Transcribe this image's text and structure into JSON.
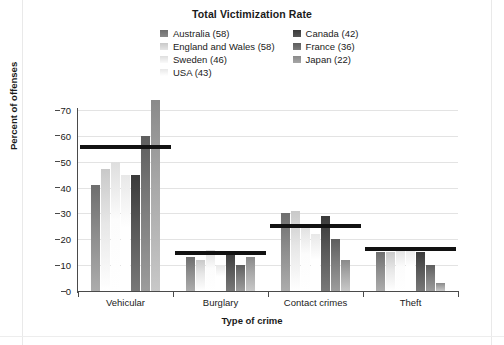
{
  "chart_data": {
    "type": "bar",
    "title": "Total Victimization Rate",
    "xlabel": "Type of crime",
    "ylabel": "Percent of offenses",
    "categories": [
      "Vehicular",
      "Burglary",
      "Contact crimes",
      "Theft"
    ],
    "ylim": [
      0,
      70
    ],
    "yticks": [
      0,
      10,
      20,
      30,
      40,
      50,
      60,
      70
    ],
    "grid": true,
    "legend_position": "top-center",
    "series": [
      {
        "name": "Australia (58)",
        "color": "#6e6e6e",
        "values": [
          41,
          13,
          30,
          15
        ]
      },
      {
        "name": "England and Wales (58)",
        "color": "#c9c9c9",
        "values": [
          47,
          12,
          31,
          15
        ]
      },
      {
        "name": "Sweden (46)",
        "color": "#dedede",
        "values": [
          50,
          16,
          26,
          17
        ]
      },
      {
        "name": "USA (43)",
        "color": "#e8e8e8",
        "values": [
          45,
          10,
          22,
          17
        ]
      },
      {
        "name": "Canada (42)",
        "color": "#3a3a3a",
        "values": [
          45,
          15,
          29,
          15
        ]
      },
      {
        "name": "France (36)",
        "color": "#5e5e5e",
        "values": [
          60,
          10,
          20,
          10
        ]
      },
      {
        "name": "Japan (22)",
        "color": "#8a8a8a",
        "values": [
          74,
          13,
          12,
          3
        ]
      }
    ],
    "mean_lines": {
      "label": "group mean",
      "values": [
        55,
        14,
        24.5,
        15.5
      ]
    }
  }
}
